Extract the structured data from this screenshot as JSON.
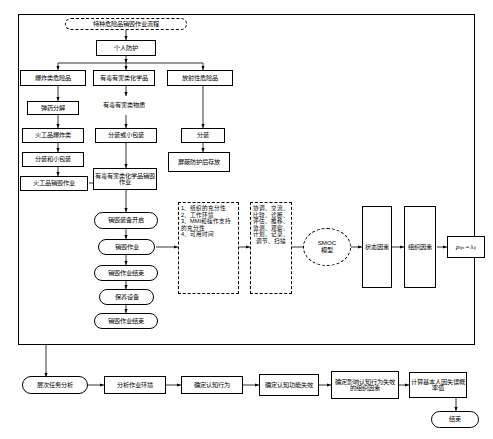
{
  "diagram": {
    "title": "特种危险品销毁作业流程",
    "top_group": {
      "nodes": [
        {
          "id": "n_title",
          "label": "特种危险品销毁作业流程"
        },
        {
          "id": "n_ppe",
          "label": "个人防护"
        },
        {
          "id": "n_explosive",
          "label": "爆炸类危险品"
        },
        {
          "id": "n_toxic",
          "label": "有毒有害类化学品"
        },
        {
          "id": "n_radio",
          "label": "放射性危险品"
        },
        {
          "id": "n_toxic_sub",
          "label": "有毒有害类物质"
        },
        {
          "id": "n_decomp",
          "label": "弹药分解"
        },
        {
          "id": "n_fire",
          "label": "火工品爆炸类"
        },
        {
          "id": "n_pack",
          "label": "分装或小包装"
        },
        {
          "id": "n_split",
          "label": "分装"
        },
        {
          "id": "n_pack_small",
          "label": "分装和小包装"
        },
        {
          "id": "n_shield",
          "label": "屏蔽防护后存放"
        },
        {
          "id": "n_fire_destroy",
          "label": "火工品销毁作业"
        },
        {
          "id": "n_toxic_destroy",
          "label": "有毒有害类化学品销毁作业"
        },
        {
          "id": "n_open",
          "label": "销毁装备开启"
        },
        {
          "id": "n_destroy_op",
          "label": "销毁作业"
        },
        {
          "id": "n_destroy_end1",
          "label": "销毁作业结束"
        },
        {
          "id": "n_maintain",
          "label": "保养设备"
        },
        {
          "id": "n_destroy_end2",
          "label": "销毁作业结束"
        }
      ],
      "factor_list": "1、组织的充分性\n2、工作环境\n3、MMI和操作支持的充分性\n4、可用时间",
      "action_list": "协调、交流、比较、诊断、评估、推移、监测、观察、计划、记录、调节、扫描",
      "smoc": "SMOC\n模型",
      "state_factor": "状态因素",
      "organization_factor": "组织因素",
      "formula_p": "p",
      "formula_sub": "ijn",
      "formula_eq": "=",
      "formula_lambda": "λ",
      "formula_lambda_sub": "ij"
    },
    "bottom_flow": [
      {
        "id": "b1",
        "label": "层次任务分析",
        "shape": "round"
      },
      {
        "id": "b2",
        "label": "分析作业环境",
        "shape": "rect"
      },
      {
        "id": "b3",
        "label": "确定认知行为",
        "shape": "rect"
      },
      {
        "id": "b4",
        "label": "确定认知功能失效",
        "shape": "rect"
      },
      {
        "id": "b5",
        "label": "确定影响认知行为失效的组织因素",
        "shape": "rect"
      },
      {
        "id": "b6",
        "label": "计算基本人因失误概率值",
        "shape": "rect"
      },
      {
        "id": "b7",
        "label": "结束",
        "shape": "round"
      }
    ]
  }
}
